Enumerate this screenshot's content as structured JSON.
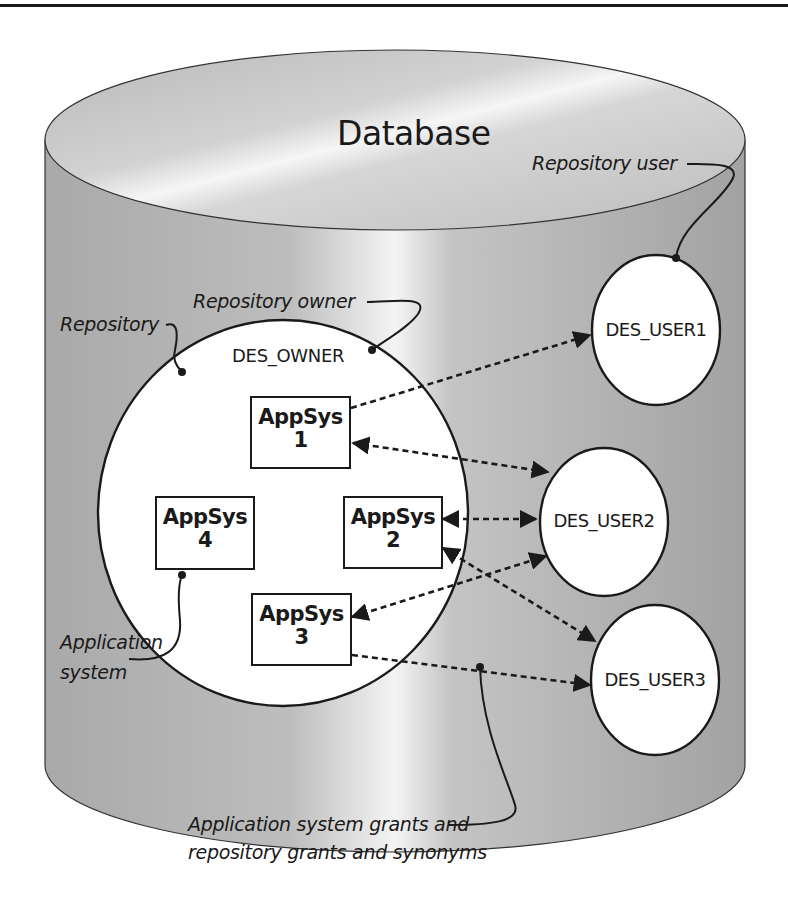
{
  "diagram": {
    "title": "Database",
    "colors": {
      "cylinder_body": "#a8a8a8",
      "cylinder_top": "#c8c8c8",
      "highlight": "#f2f2f2",
      "stroke": "#1a1a1a",
      "fill_white": "#ffffff"
    },
    "repository": {
      "label": "Repository",
      "owner_label": "Repository owner",
      "owner_name": "DES_OWNER"
    },
    "app_systems": [
      {
        "name": "AppSys",
        "number": "1"
      },
      {
        "name": "AppSys",
        "number": "2"
      },
      {
        "name": "AppSys",
        "number": "3"
      },
      {
        "name": "AppSys",
        "number": "4"
      }
    ],
    "users": [
      {
        "name": "DES_USER1"
      },
      {
        "name": "DES_USER2"
      },
      {
        "name": "DES_USER3"
      }
    ],
    "annotations": {
      "repository_user": "Repository user",
      "application_system_line1": "Application",
      "application_system_line2": "system",
      "grants_line1": "Application system grants and",
      "grants_line2": "repository grants and synonyms"
    },
    "connections": [
      {
        "from": "AppSys 1",
        "to": "DES_USER1",
        "style": "dashed",
        "arrow": "end"
      },
      {
        "from": "AppSys 1",
        "to": "DES_USER2",
        "style": "dashed",
        "arrow": "both"
      },
      {
        "from": "AppSys 2",
        "to": "DES_USER2",
        "style": "dashed",
        "arrow": "both"
      },
      {
        "from": "AppSys 2",
        "to": "DES_USER3",
        "style": "dashed",
        "arrow": "both"
      },
      {
        "from": "AppSys 3",
        "to": "DES_USER2",
        "style": "dashed",
        "arrow": "both"
      },
      {
        "from": "AppSys 3",
        "to": "DES_USER3",
        "style": "dashed",
        "arrow": "end"
      }
    ]
  }
}
